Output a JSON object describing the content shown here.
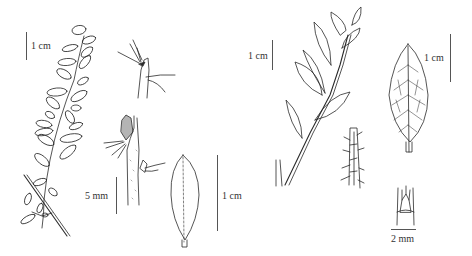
{
  "figure": {
    "panels": [
      {
        "id": "A",
        "description": "Leafy branch with small elliptic leaves",
        "scale_label": "1 cm"
      },
      {
        "id": "B",
        "description": "Node detail with hairs"
      },
      {
        "id": "C",
        "description": "Stem node with bud",
        "scale_label": "5 mm"
      },
      {
        "id": "D",
        "description": "Elliptic leaf, stippled surface",
        "scale_label": "1 cm"
      },
      {
        "id": "E",
        "description": "Leafy branch with larger serrate leaves",
        "scale_label": "1 cm"
      },
      {
        "id": "F",
        "description": "Hairy stem segment detail"
      },
      {
        "id": "G",
        "description": "Reticulate-veined serrate leaf",
        "scale_label": "1 cm"
      },
      {
        "id": "H",
        "description": "Stipule / ligule detail",
        "scale_label": "2 mm"
      }
    ]
  },
  "colors": {
    "ink": "#2a2a2a",
    "background": "#ffffff"
  }
}
